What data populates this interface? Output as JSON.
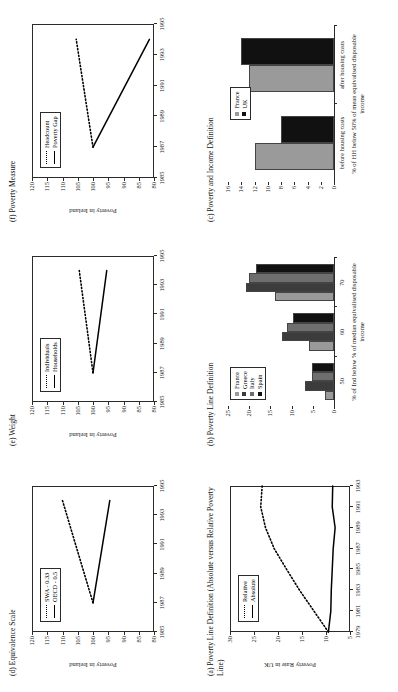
{
  "figure": {
    "panels": [
      {
        "id": "a",
        "title": "(a) Poverty Line Definition (Absolute versus Relative Poverty Line)",
        "ylabel": "Poverty Rate in UK",
        "xlabel": ""
      },
      {
        "id": "b",
        "title": "(b) Poverty Line Definition",
        "ylabel": "",
        "xlabel": "% of Ind below % of median equivalised disposable income"
      },
      {
        "id": "c",
        "title": "(c) Poverty and Income Definition",
        "ylabel": "",
        "xlabel": "% of HH below 50% of mean equivalised disposable income"
      },
      {
        "id": "d",
        "title": "(d) Equivalence Scale",
        "ylabel": "Poverty in Ireland",
        "xlabel": ""
      },
      {
        "id": "e",
        "title": "(e) Weight",
        "ylabel": "Poverty in Ireland",
        "xlabel": ""
      },
      {
        "id": "f",
        "title": "(f) Poverty Measure",
        "ylabel": "Poverty in Ireland",
        "xlabel": ""
      }
    ]
  },
  "chart_data": [
    {
      "panel": "a",
      "type": "line",
      "title": "(a) Poverty Line Definition (Absolute versus Relative Poverty Line)",
      "xlabel": "",
      "ylabel": "Poverty Rate in UK",
      "x": [
        1979,
        1981,
        1983,
        1985,
        1987,
        1989,
        1991,
        1993
      ],
      "xlim": [
        1979,
        1993
      ],
      "ylim": [
        5,
        30
      ],
      "yticks": [
        5,
        10,
        15,
        20,
        25,
        30
      ],
      "xticks": [
        1979,
        1981,
        1983,
        1985,
        1987,
        1989,
        1991,
        1993
      ],
      "grid": false,
      "legend_position": "upper-left",
      "series": [
        {
          "name": "Relative",
          "style": "dotted",
          "values": [
            9.5,
            12.5,
            15.5,
            18.2,
            20.8,
            22.6,
            23.6,
            23.3
          ]
        },
        {
          "name": "Absolute",
          "style": "solid",
          "values": [
            9.5,
            9.0,
            8.9,
            8.7,
            8.5,
            8.1,
            8.7,
            8.6
          ]
        }
      ]
    },
    {
      "panel": "b",
      "type": "bar",
      "title": "(b) Poverty Line Definition",
      "xlabel": "% of Ind below % of median equivalised disposable income",
      "ylabel": "",
      "categories": [
        "50",
        "60",
        "70"
      ],
      "ylim": [
        0,
        25
      ],
      "yticks": [
        0,
        5,
        10,
        15,
        20,
        25
      ],
      "grid": false,
      "legend_position": "upper-left",
      "series": [
        {
          "name": "France",
          "color": "#9a9a9a",
          "values": [
            2.2,
            6.0,
            13.8
          ]
        },
        {
          "name": "Greece",
          "color": "#3c3c3c",
          "values": [
            6.8,
            12.2,
            20.8
          ]
        },
        {
          "name": "Italy",
          "color": "#6e6e6e",
          "values": [
            5.3,
            11.1,
            20.0
          ]
        },
        {
          "name": "Spain",
          "color": "#111111",
          "values": [
            5.2,
            9.6,
            18.3
          ]
        }
      ]
    },
    {
      "panel": "c",
      "type": "bar",
      "title": "(c) Poverty and Income Definition",
      "xlabel": "% of HH below 50% of mean equivalised disposable income",
      "ylabel": "",
      "categories": [
        "before housing costs",
        "after housing costs"
      ],
      "ylim": [
        0,
        16
      ],
      "yticks": [
        0,
        2,
        4,
        6,
        8,
        10,
        12,
        14,
        16
      ],
      "grid": false,
      "legend_position": "upper-center",
      "series": [
        {
          "name": "France",
          "color": "#9a9a9a",
          "values": [
            12.0,
            12.8
          ]
        },
        {
          "name": "UK",
          "color": "#111111",
          "values": [
            8.0,
            14.0
          ]
        }
      ]
    },
    {
      "panel": "d",
      "type": "line",
      "title": "(d) Equivalence Scale",
      "xlabel": "",
      "ylabel": "Poverty in Ireland",
      "x": [
        1987,
        1994
      ],
      "xlim": [
        1985,
        1995
      ],
      "ylim": [
        80,
        120
      ],
      "yticks": [
        80,
        85,
        90,
        95,
        100,
        105,
        110,
        115,
        120
      ],
      "xticks": [
        1985,
        1987,
        1989,
        1991,
        1993,
        1995
      ],
      "grid": false,
      "legend_position": "upper-left",
      "series": [
        {
          "name": "SWA - 0.33",
          "style": "dotted",
          "values": [
            100,
            110
          ]
        },
        {
          "name": "OECD - 0.5",
          "style": "solid",
          "values": [
            100,
            94.5
          ]
        }
      ]
    },
    {
      "panel": "e",
      "type": "line",
      "title": "(e) Weight",
      "xlabel": "",
      "ylabel": "Poverty in Ireland",
      "x": [
        1987,
        1994
      ],
      "xlim": [
        1985,
        1995
      ],
      "ylim": [
        80,
        120
      ],
      "yticks": [
        80,
        85,
        90,
        95,
        100,
        105,
        110,
        115,
        120
      ],
      "xticks": [
        1985,
        1987,
        1989,
        1991,
        1993,
        1995
      ],
      "grid": false,
      "legend_position": "upper-left",
      "series": [
        {
          "name": "Individuals",
          "style": "dotted",
          "values": [
            100,
            104.5
          ]
        },
        {
          "name": "Households",
          "style": "solid",
          "values": [
            100,
            95.5
          ]
        }
      ]
    },
    {
      "panel": "f",
      "type": "line",
      "title": "(f) Poverty Measure",
      "xlabel": "",
      "ylabel": "Poverty in Ireland",
      "x": [
        1987,
        1994
      ],
      "xlim": [
        1985,
        1995
      ],
      "ylim": [
        80,
        120
      ],
      "yticks": [
        80,
        85,
        90,
        95,
        100,
        105,
        110,
        115,
        120
      ],
      "xticks": [
        1985,
        1987,
        1989,
        1991,
        1993,
        1995
      ],
      "grid": false,
      "legend_position": "upper-left",
      "series": [
        {
          "name": "Headcount",
          "style": "dotted",
          "values": [
            100,
            105.5
          ]
        },
        {
          "name": "Poverty Gap",
          "style": "solid",
          "values": [
            100,
            81.5
          ]
        }
      ]
    }
  ]
}
